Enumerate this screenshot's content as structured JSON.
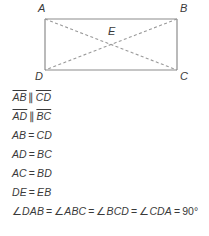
{
  "figure": {
    "name": "rectangle-abcd-with-diagonals",
    "vertices": [
      {
        "id": "A",
        "label": "A",
        "x": 45,
        "y": 19,
        "label_x": 38,
        "label_y": 12
      },
      {
        "id": "B",
        "label": "B",
        "x": 177,
        "y": 19,
        "label_x": 180,
        "label_y": 12
      },
      {
        "id": "C",
        "label": "C",
        "x": 177,
        "y": 70,
        "label_x": 180,
        "label_y": 80
      },
      {
        "id": "D",
        "label": "D",
        "x": 45,
        "y": 70,
        "label_x": 35,
        "label_y": 80
      }
    ],
    "center": {
      "id": "E",
      "label": "E",
      "x": 111,
      "y": 44.5,
      "label_x": 108,
      "label_y": 35
    },
    "edge_color": "#8c8c8c",
    "diagonal_color": "#9a9a9a",
    "label_color": "#3a3a3a",
    "edges": [
      {
        "name": "edge-AB",
        "from": "A",
        "to": "B",
        "style": "solid"
      },
      {
        "name": "edge-BC",
        "from": "B",
        "to": "C",
        "style": "solid"
      },
      {
        "name": "edge-CD",
        "from": "C",
        "to": "D",
        "style": "solid"
      },
      {
        "name": "edge-DA",
        "from": "D",
        "to": "A",
        "style": "solid"
      }
    ],
    "diagonals": [
      {
        "name": "diagonal-AC",
        "from": "A",
        "to": "C",
        "style": "dashed"
      },
      {
        "name": "diagonal-BD",
        "from": "B",
        "to": "D",
        "style": "dashed"
      }
    ]
  },
  "properties": {
    "lines": [
      {
        "name": "property-ab-parallel-cd",
        "parts": [
          {
            "type": "segment",
            "text": "AB"
          },
          {
            "type": "symbol",
            "text": "∥"
          },
          {
            "type": "segment",
            "text": "CD"
          }
        ]
      },
      {
        "name": "property-ad-parallel-bc",
        "parts": [
          {
            "type": "segment",
            "text": "AD"
          },
          {
            "type": "symbol",
            "text": "∥"
          },
          {
            "type": "segment",
            "text": "BC"
          }
        ]
      },
      {
        "name": "property-ab-equals-cd",
        "parts": [
          {
            "type": "text",
            "text": "AB"
          },
          {
            "type": "equals",
            "text": "="
          },
          {
            "type": "text",
            "text": "CD"
          }
        ]
      },
      {
        "name": "property-ad-equals-bc",
        "parts": [
          {
            "type": "text",
            "text": "AD"
          },
          {
            "type": "equals",
            "text": "="
          },
          {
            "type": "text",
            "text": "BC"
          }
        ]
      },
      {
        "name": "property-ac-equals-bd",
        "parts": [
          {
            "type": "text",
            "text": "AC"
          },
          {
            "type": "equals",
            "text": "="
          },
          {
            "type": "text",
            "text": "BD"
          }
        ]
      },
      {
        "name": "property-de-equals-eb",
        "parts": [
          {
            "type": "text",
            "text": "DE"
          },
          {
            "type": "equals",
            "text": "="
          },
          {
            "type": "text",
            "text": "EB"
          }
        ]
      },
      {
        "name": "property-all-angles-90",
        "parts": [
          {
            "type": "angle",
            "text": "∠"
          },
          {
            "type": "text",
            "text": "DAB"
          },
          {
            "type": "equals",
            "text": "="
          },
          {
            "type": "angle",
            "text": "∠"
          },
          {
            "type": "text",
            "text": "ABC"
          },
          {
            "type": "equals",
            "text": "="
          },
          {
            "type": "angle",
            "text": "∠"
          },
          {
            "type": "text",
            "text": "BCD"
          },
          {
            "type": "equals",
            "text": "="
          },
          {
            "type": "angle",
            "text": "∠"
          },
          {
            "type": "text",
            "text": "CDA"
          },
          {
            "type": "equals",
            "text": "="
          },
          {
            "type": "degrees",
            "text": "90°"
          }
        ]
      }
    ]
  }
}
